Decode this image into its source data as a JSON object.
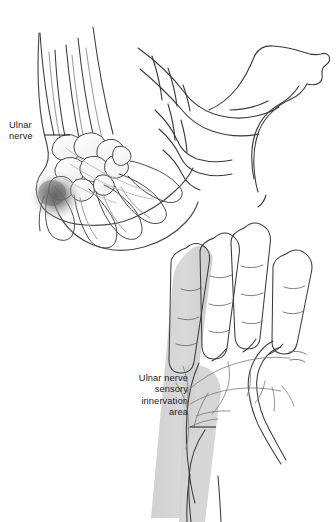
{
  "figure": {
    "background_color": "#ffffff",
    "width": 336,
    "height": 522
  },
  "labels": {
    "ulnar_nerve": {
      "name": "ulnar-nerve-label",
      "lines": [
        "Ulnar",
        "nerve"
      ],
      "text": "Ulnar\nnerve",
      "align": "left",
      "leader_line": true,
      "color": "#1d1d1d"
    },
    "sensory_area": {
      "name": "ulnar-nerve-sensory-innervation-area-label",
      "lines": [
        "Ulnar nerve",
        "sensory",
        "innervation",
        "area"
      ],
      "text": "Ulnar nerve\nsensory\ninnervation\narea",
      "align": "right",
      "leader_line": true,
      "color": "#1d1d1d"
    }
  },
  "panels": {
    "upper": {
      "name": "wrist-skeleton-panel",
      "caption": "Skeletal view of wrist and hand showing ulnar nerve compression site",
      "shading": {
        "compression_blob_color": "#6e6e6e",
        "bone_fill": "#fbfbfb",
        "bone_stroke": "#3a3a3a"
      }
    },
    "lower": {
      "name": "palmar-hand-panel",
      "caption": "Palmar view of hand with ulnar nerve sensory territory shaded",
      "shading": {
        "innervation_band_color": "#d2d2d2",
        "skin_stroke": "#3a3a3a",
        "nerve_branch_stroke": "#6f6f6f"
      }
    }
  },
  "colors": {
    "ink": "#3a3a3a",
    "ink_light": "#8a8a8a",
    "text": "#1d1d1d",
    "shade_gray": "#d2d2d2",
    "blob_gray": "#6e6e6e",
    "paper": "#ffffff"
  }
}
